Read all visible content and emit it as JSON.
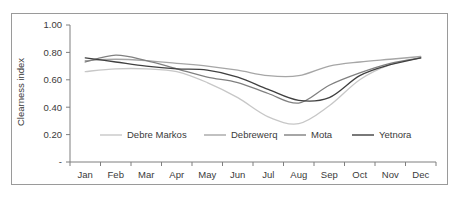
{
  "figure": {
    "border_color": "#9a9a9a",
    "background": "#ffffff"
  },
  "chart_data": {
    "type": "line",
    "title": "",
    "xlabel": "",
    "ylabel": "Clearness index",
    "ylim": [
      0,
      1.0
    ],
    "yticks": [
      0,
      0.2,
      0.4,
      0.6,
      0.8,
      1.0
    ],
    "ytick_labels": [
      "-",
      "0.20",
      "0.40",
      "0.60",
      "0.80",
      "1.00"
    ],
    "grid": false,
    "legend_position": "inside-bottom",
    "categories": [
      "Jan",
      "Feb",
      "Mar",
      "Apr",
      "May",
      "Jun",
      "Jul",
      "Aug",
      "Sep",
      "Oct",
      "Nov",
      "Dec"
    ],
    "series": [
      {
        "name": "Debre Markos",
        "color": "#c7c7c7",
        "values": [
          0.66,
          0.68,
          0.68,
          0.66,
          0.58,
          0.47,
          0.33,
          0.28,
          0.41,
          0.6,
          0.71,
          0.76
        ]
      },
      {
        "name": "Debrewerq",
        "color": "#a6a6a6",
        "values": [
          0.74,
          0.75,
          0.74,
          0.72,
          0.7,
          0.67,
          0.63,
          0.63,
          0.7,
          0.73,
          0.75,
          0.77
        ]
      },
      {
        "name": "Mota",
        "color": "#808080",
        "values": [
          0.73,
          0.78,
          0.74,
          0.68,
          0.62,
          0.58,
          0.5,
          0.43,
          0.56,
          0.65,
          0.72,
          0.76
        ]
      },
      {
        "name": "Yetnora",
        "color": "#404040",
        "values": [
          0.76,
          0.73,
          0.7,
          0.68,
          0.67,
          0.62,
          0.53,
          0.45,
          0.47,
          0.63,
          0.71,
          0.76
        ]
      }
    ]
  },
  "legend": {
    "items": [
      {
        "label": "Debre Markos",
        "color": "#c7c7c7"
      },
      {
        "label": "Debrewerq",
        "color": "#a6a6a6"
      },
      {
        "label": "Mota",
        "color": "#808080"
      },
      {
        "label": "Yetnora",
        "color": "#404040"
      }
    ]
  }
}
